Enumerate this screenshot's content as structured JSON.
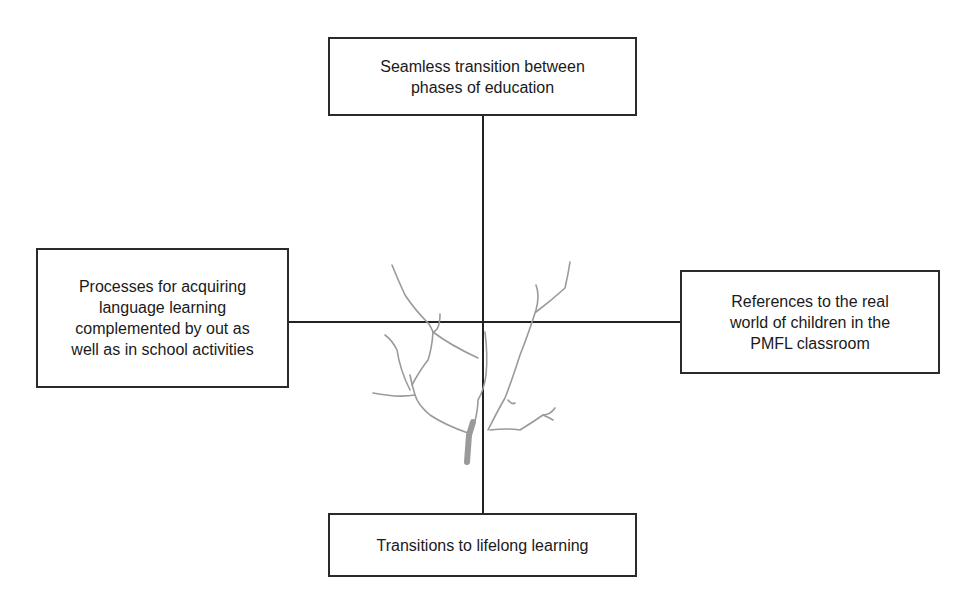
{
  "diagram": {
    "top_box": {
      "text": "Seamless transition between\nphases of education"
    },
    "left_box": {
      "text": "Processes for acquiring\nlanguage learning\ncomplemented by out as\nwell as in school activities"
    },
    "right_box": {
      "text": "References to the real\nworld of children in the\nPMFL classroom"
    },
    "bottom_box": {
      "text": "Transitions to lifelong learning"
    },
    "center_image": "tree-illustration",
    "line_color": "#222222",
    "tree_color": "#9a9a9a"
  }
}
